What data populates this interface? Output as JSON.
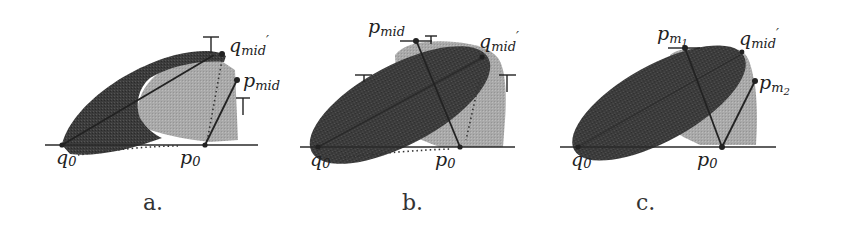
{
  "figure": {
    "panels": [
      {
        "id": "a",
        "caption": "a.",
        "labels": {
          "q0": {
            "base": "q",
            "sub": "0"
          },
          "p0": {
            "base": "p",
            "sub": "0"
          },
          "q_mid_prime": {
            "base": "q",
            "sub": "mid",
            "prime": "′"
          },
          "p_mid": {
            "base": "p",
            "sub": "mid"
          }
        }
      },
      {
        "id": "b",
        "caption": "b.",
        "labels": {
          "q0": {
            "base": "q",
            "sub": "0"
          },
          "p0": {
            "base": "p",
            "sub": "0"
          },
          "p_mid": {
            "base": "p",
            "sub": "mid"
          },
          "q_mid_prime": {
            "base": "q",
            "sub": "mid",
            "prime": "′"
          }
        }
      },
      {
        "id": "c",
        "caption": "c.",
        "labels": {
          "q0": {
            "base": "q",
            "sub": "0"
          },
          "p0": {
            "base": "p",
            "sub": "0"
          },
          "p_m1": {
            "base": "p",
            "sub": "m",
            "subsub": "1"
          },
          "q_mid_prime": {
            "base": "q",
            "sub": "mid",
            "prime": "′"
          },
          "p_m2": {
            "base": "p",
            "sub": "m",
            "subsub": "2"
          }
        }
      }
    ],
    "colors": {
      "dark_region": "#3a3a3a",
      "light_region": "#a8a8a8",
      "line": "#2a2a2a",
      "background": "#ffffff"
    }
  }
}
